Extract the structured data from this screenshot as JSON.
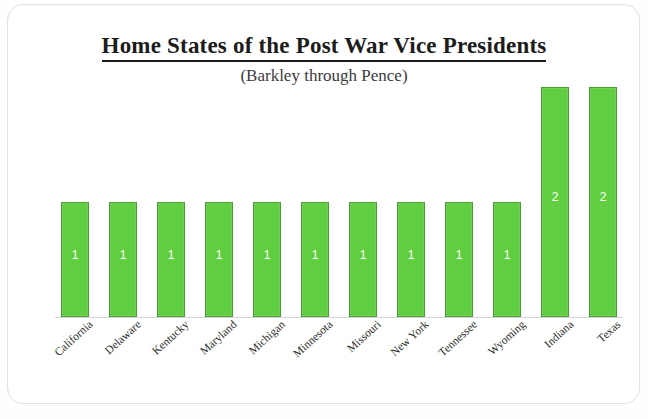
{
  "chart_data": {
    "type": "bar",
    "title": "Home States of the Post War Vice Presidents",
    "subtitle": "(Barkley through Pence)",
    "xlabel": "",
    "ylabel": "",
    "ylim": [
      0,
      2.05
    ],
    "grid": false,
    "legend": false,
    "data_labels_shown": true,
    "bar_color": "#61ce41",
    "bar_border_color": "#4a9c33",
    "data_label_color": "#ffffff",
    "categories": [
      "California",
      "Delaware",
      "Kentucky",
      "Maryland",
      "Michigan",
      "Minnesota",
      "Missouri",
      "New York",
      "Tennessee",
      "Wyoming",
      "Indiana",
      "Texas"
    ],
    "values": [
      1,
      1,
      1,
      1,
      1,
      1,
      1,
      1,
      1,
      1,
      2,
      2
    ],
    "value_labels": [
      "1",
      "1",
      "1",
      "1",
      "1",
      "1",
      "1",
      "1",
      "1",
      "1",
      "2",
      "2"
    ]
  }
}
